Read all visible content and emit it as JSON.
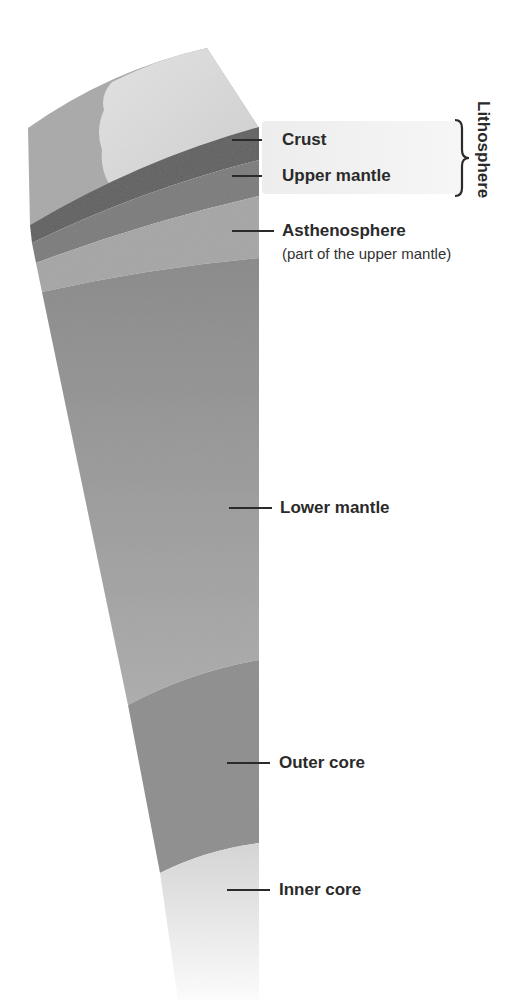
{
  "diagram": {
    "colors": {
      "surface_land": "#d9d9d9",
      "surface_ocean": "#a9a9a9",
      "crust": "#5f5f5f",
      "upper_mantle": "#7a7a7a",
      "asthenosphere": "#a5a5a5",
      "lower_mantle_top": "#8b8b8b",
      "lower_mantle_bottom": "#a9a9a9",
      "outer_core": "#8d8d8d",
      "inner_core": "#d8d8d8",
      "leader_line": "#2a2a2a",
      "text": "#2a2a2a"
    },
    "layers": [
      {
        "id": "crust",
        "label": "Crust",
        "leader_y": 140
      },
      {
        "id": "upper_mantle",
        "label": "Upper mantle",
        "leader_y": 176
      },
      {
        "id": "asthenosphere",
        "label": "Asthenosphere",
        "note": "(part of the upper mantle)",
        "leader_y": 231
      },
      {
        "id": "lower_mantle",
        "label": "Lower mantle",
        "leader_y": 508
      },
      {
        "id": "outer_core",
        "label": "Outer core",
        "leader_y": 763
      },
      {
        "id": "inner_core",
        "label": "Inner core",
        "leader_y": 890
      }
    ],
    "group": {
      "label": "Lithosphere",
      "includes": [
        "Crust",
        "Upper mantle"
      ],
      "brace": "}"
    }
  }
}
